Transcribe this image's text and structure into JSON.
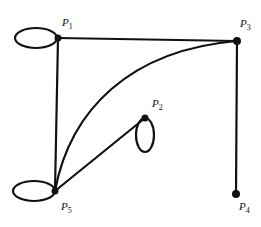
{
  "graph": {
    "vertices": [
      {
        "id": "P1",
        "label": "P",
        "sub": "1",
        "x": 58,
        "y": 38,
        "lx": 62,
        "ly": 26
      },
      {
        "id": "P2",
        "label": "P",
        "sub": "2",
        "x": 145,
        "y": 118,
        "lx": 152,
        "ly": 107
      },
      {
        "id": "P3",
        "label": "P",
        "sub": "3",
        "x": 237,
        "y": 41,
        "lx": 240,
        "ly": 27
      },
      {
        "id": "P4",
        "label": "P",
        "sub": "4",
        "x": 236,
        "y": 194,
        "lx": 239,
        "ly": 210
      },
      {
        "id": "P5",
        "label": "P",
        "sub": "5",
        "x": 55,
        "y": 191,
        "lx": 61,
        "ly": 210
      }
    ],
    "edges": [
      {
        "from": "P1",
        "to": "P3",
        "type": "straight"
      },
      {
        "from": "P1",
        "to": "P5",
        "type": "straight"
      },
      {
        "from": "P3",
        "to": "P4",
        "type": "straight"
      },
      {
        "from": "P5",
        "to": "P3",
        "type": "curve"
      },
      {
        "from": "P5",
        "to": "P2",
        "type": "straight"
      }
    ],
    "loops": [
      {
        "at": "P1",
        "cx": 36,
        "cy": 38,
        "rx": 21,
        "ry": 10
      },
      {
        "at": "P2",
        "cx": 145,
        "cy": 135,
        "rx": 9,
        "ry": 17
      },
      {
        "at": "P5",
        "cx": 34,
        "cy": 191,
        "rx": 21,
        "ry": 10
      }
    ],
    "color": "#111111"
  }
}
